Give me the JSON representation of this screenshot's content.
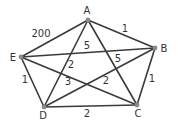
{
  "graph": {
    "vertices": [
      {
        "id": "A",
        "label": "A",
        "x": 88,
        "y": 20,
        "lx": 87,
        "ly": 14
      },
      {
        "id": "B",
        "label": "B",
        "x": 155,
        "y": 48,
        "lx": 164,
        "ly": 52
      },
      {
        "id": "C",
        "label": "C",
        "x": 137,
        "y": 105,
        "lx": 138,
        "ly": 117
      },
      {
        "id": "D",
        "label": "D",
        "x": 44,
        "y": 107,
        "lx": 43,
        "ly": 119
      },
      {
        "id": "E",
        "label": "E",
        "x": 21,
        "y": 57,
        "lx": 13,
        "ly": 61
      }
    ],
    "edges": [
      {
        "from": "A",
        "to": "E",
        "weight": "200",
        "lx": 41,
        "ly": 37
      },
      {
        "from": "A",
        "to": "B",
        "weight": "1",
        "lx": 125,
        "ly": 32
      },
      {
        "from": "E",
        "to": "B",
        "weight": "5",
        "lx": 87,
        "ly": 49
      },
      {
        "from": "A",
        "to": "C",
        "weight": "5",
        "lx": 118,
        "ly": 62
      },
      {
        "from": "A",
        "to": "D",
        "weight": "2",
        "lx": 71,
        "ly": 68
      },
      {
        "from": "E",
        "to": "C",
        "weight": "3",
        "lx": 68,
        "ly": 85
      },
      {
        "from": "D",
        "to": "B",
        "weight": "2",
        "lx": 106,
        "ly": 84
      },
      {
        "from": "E",
        "to": "D",
        "weight": "1",
        "lx": 25,
        "ly": 83
      },
      {
        "from": "B",
        "to": "C",
        "weight": "1",
        "lx": 152,
        "ly": 82
      },
      {
        "from": "D",
        "to": "C",
        "weight": "2",
        "lx": 87,
        "ly": 117
      }
    ]
  }
}
